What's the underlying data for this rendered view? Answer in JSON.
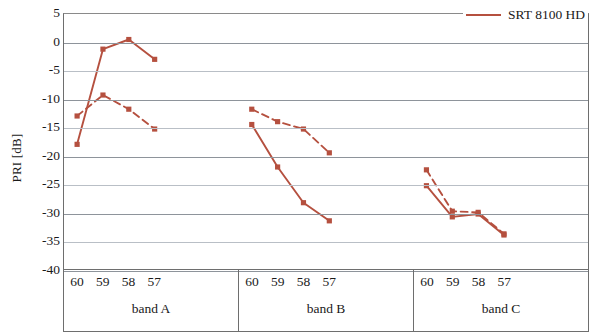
{
  "chart_data": {
    "type": "line",
    "title": "",
    "xlabel": "",
    "ylabel": "PRI [dB]",
    "ylim": [
      -40,
      5
    ],
    "yticks": [
      5,
      0,
      -5,
      -10,
      -15,
      -20,
      -25,
      -30,
      -35,
      -40
    ],
    "ytick_labels": [
      "5",
      "0",
      "-5",
      "-10",
      "-15",
      "-20",
      "-25",
      "-30",
      "-35",
      "-40"
    ],
    "grid": true,
    "legend_position": "top-right",
    "groups": [
      {
        "name": "band A",
        "x": [
          "60",
          "59",
          "58",
          "57"
        ]
      },
      {
        "name": "band B",
        "x": [
          "60",
          "59",
          "58",
          "57"
        ]
      },
      {
        "name": "band C",
        "x": [
          "60",
          "59",
          "58",
          "57"
        ]
      }
    ],
    "categories": [
      "60",
      "59",
      "58",
      "57",
      "60",
      "59",
      "58",
      "57",
      "60",
      "59",
      "58",
      "57"
    ],
    "series": [
      {
        "name": "SRT 8100 HD",
        "style": "solid",
        "color": "#b5503f",
        "in_legend": true,
        "values": [
          -18.0,
          -1.2,
          0.5,
          -3.0,
          -14.5,
          -22.0,
          -28.3,
          -31.5,
          -25.3,
          -30.8,
          -30.3,
          -34.0
        ]
      },
      {
        "name": "",
        "style": "dashed",
        "color": "#b5503f",
        "in_legend": false,
        "values": [
          -13.0,
          -9.3,
          -11.8,
          -15.3,
          -11.8,
          -14.0,
          -15.3,
          -19.5,
          -22.5,
          -29.8,
          -30.0,
          -33.8
        ]
      }
    ],
    "colors": {
      "series_primary": "#b5503f",
      "grid": "#b9bfc6",
      "axis": "#6e6e6e"
    }
  },
  "legend": {
    "entries": [
      {
        "label": "SRT 8100 HD",
        "color": "#b5503f",
        "style": "solid"
      }
    ]
  },
  "axes": {
    "y_title": "PRI [dB]"
  }
}
